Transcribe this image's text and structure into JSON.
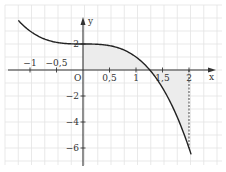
{
  "chart_data": {
    "type": "line",
    "title": "",
    "function": "f(x) = 2 - x^3",
    "xlabel": "x",
    "ylabel": "y",
    "origin_label": "O",
    "xlim": [
      -1.3,
      2.3
    ],
    "ylim": [
      -7.2,
      4.5
    ],
    "grid": true,
    "x_ticks": [
      {
        "value": -1,
        "label": "−1"
      },
      {
        "value": -0.5,
        "label": "−0,5"
      },
      {
        "value": 0.5,
        "label": "0,5"
      },
      {
        "value": 1,
        "label": "1"
      },
      {
        "value": 1.5,
        "label": "1,5"
      },
      {
        "value": 2,
        "label": "2"
      }
    ],
    "y_ticks": [
      {
        "value": 2,
        "label": "2"
      },
      {
        "value": -2,
        "label": "−2"
      },
      {
        "value": -4,
        "label": "−4"
      },
      {
        "value": -6,
        "label": "−6"
      }
    ],
    "series": [
      {
        "name": "curve",
        "x": [
          -1.22,
          -1.0,
          -0.75,
          -0.5,
          -0.25,
          0,
          0.25,
          0.5,
          0.75,
          1.0,
          1.26,
          1.5,
          1.75,
          2.0,
          2.05
        ],
        "y": [
          3.82,
          3.0,
          2.42,
          2.13,
          2.02,
          2.0,
          1.98,
          1.88,
          1.58,
          1.0,
          0.0,
          -1.38,
          -3.36,
          -6.0,
          -6.62
        ]
      }
    ],
    "shaded_region": {
      "from_x": 0,
      "to_x": 2,
      "between": "curve and x-axis",
      "root_x": 1.26
    },
    "dashed_line": {
      "x": 2,
      "from_y": 0,
      "to_y": -6
    },
    "colors": {
      "curve": "#222222",
      "axis": "#333333",
      "grid": "#e3e3e3",
      "shade": "#ececec"
    }
  }
}
